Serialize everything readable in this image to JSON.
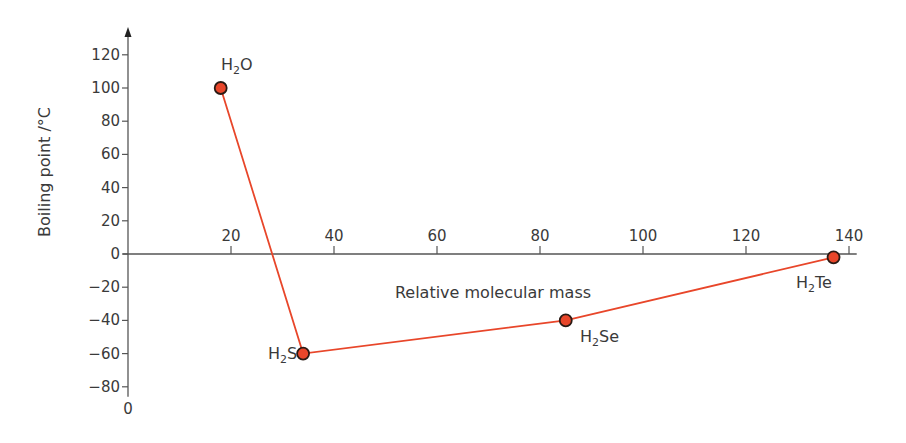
{
  "chart_data": {
    "type": "line",
    "title": "",
    "xlabel": "Relative molecular mass",
    "ylabel": "Boiling point /°C",
    "xlim": [
      0,
      140
    ],
    "ylim": [
      -80,
      120
    ],
    "x_ticks": [
      20,
      40,
      60,
      80,
      100,
      120,
      140
    ],
    "y_ticks": [
      120,
      100,
      80,
      60,
      40,
      20,
      0,
      -20,
      -40,
      -60,
      -80
    ],
    "origin_label": "0",
    "grid": false,
    "legend": null,
    "series": [
      {
        "name": "Group 16 hydrides",
        "color": "#e8462a",
        "points": [
          {
            "label": "H2O",
            "x": 18,
            "y": 100
          },
          {
            "label": "H2S",
            "x": 34,
            "y": -60
          },
          {
            "label": "H2Se",
            "x": 85,
            "y": -40
          },
          {
            "label": "H2Te",
            "x": 137,
            "y": -2
          }
        ]
      }
    ]
  },
  "labels": {
    "h2o": {
      "main": "H",
      "sub": "2",
      "rest": "O"
    },
    "h2s": {
      "main": "H",
      "sub": "2",
      "rest": "S"
    },
    "h2se": {
      "main": "H",
      "sub": "2",
      "rest": "Se"
    },
    "h2te": {
      "main": "H",
      "sub": "2",
      "rest": "Te"
    }
  }
}
